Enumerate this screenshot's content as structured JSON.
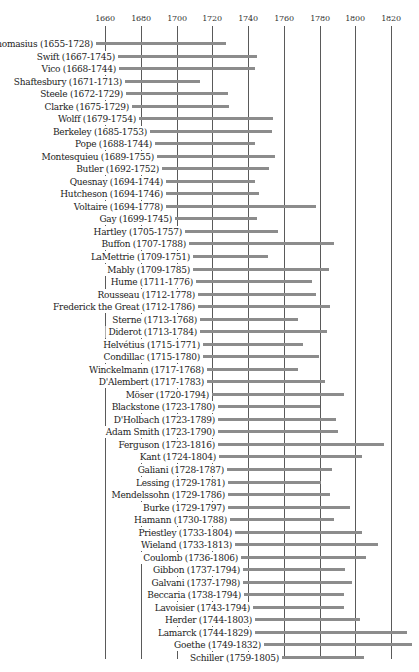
{
  "chart_data": {
    "type": "bar",
    "orientation": "horizontal-timeline",
    "title": "",
    "xlabel": "",
    "ylabel": "",
    "xlim": [
      1640,
      1836
    ],
    "grid": {
      "vertical_lines_at_ticks": true
    },
    "x_ticks": [
      1660,
      1680,
      1700,
      1720,
      1740,
      1760,
      1780,
      1800,
      1820
    ],
    "series": [
      {
        "name": "Thomasius",
        "start": 1655,
        "end": 1728,
        "label": "Thomasius (1655-1728)"
      },
      {
        "name": "Swift",
        "start": 1667,
        "end": 1745,
        "label": "Swift (1667-1745)"
      },
      {
        "name": "Vico",
        "start": 1668,
        "end": 1744,
        "label": "Vico (1668-1744)"
      },
      {
        "name": "Shaftesbury",
        "start": 1671,
        "end": 1713,
        "label": "Shaftesbury (1671-1713)"
      },
      {
        "name": "Steele",
        "start": 1672,
        "end": 1729,
        "label": "Steele (1672-1729)"
      },
      {
        "name": "Clarke",
        "start": 1675,
        "end": 1729,
        "label": "Clarke (1675-1729)"
      },
      {
        "name": "Wolff",
        "start": 1679,
        "end": 1754,
        "label": "Wolff (1679-1754)"
      },
      {
        "name": "Berkeley",
        "start": 1685,
        "end": 1753,
        "label": "Berkeley (1685-1753)"
      },
      {
        "name": "Pope",
        "start": 1688,
        "end": 1744,
        "label": "Pope (1688-1744)"
      },
      {
        "name": "Montesquieu",
        "start": 1689,
        "end": 1755,
        "label": "Montesquieu (1689-1755)"
      },
      {
        "name": "Butler",
        "start": 1692,
        "end": 1752,
        "label": "Butler (1692-1752)"
      },
      {
        "name": "Quesnay",
        "start": 1694,
        "end": 1744,
        "label": "Quesnay (1694-1744)"
      },
      {
        "name": "Hutcheson",
        "start": 1694,
        "end": 1746,
        "label": "Hutcheson (1694-1746)"
      },
      {
        "name": "Voltaire",
        "start": 1694,
        "end": 1778,
        "label": "Voltaire (1694-1778)"
      },
      {
        "name": "Gay",
        "start": 1699,
        "end": 1745,
        "label": "Gay (1699-1745)"
      },
      {
        "name": "Hartley",
        "start": 1705,
        "end": 1757,
        "label": "Hartley (1705-1757)"
      },
      {
        "name": "Buffon",
        "start": 1707,
        "end": 1788,
        "label": "Buffon (1707-1788)"
      },
      {
        "name": "LaMettrie",
        "start": 1709,
        "end": 1751,
        "label": "LaMettrie (1709-1751)"
      },
      {
        "name": "Mably",
        "start": 1709,
        "end": 1785,
        "label": "Mably (1709-1785)"
      },
      {
        "name": "Hume",
        "start": 1711,
        "end": 1776,
        "label": "Hume (1711-1776)"
      },
      {
        "name": "Rousseau",
        "start": 1712,
        "end": 1778,
        "label": "Rousseau (1712-1778)"
      },
      {
        "name": "Frederick the Great",
        "start": 1712,
        "end": 1786,
        "label": "Frederick the Great (1712-1786)"
      },
      {
        "name": "Sterne",
        "start": 1713,
        "end": 1768,
        "label": "Sterne (1713-1768)"
      },
      {
        "name": "Diderot",
        "start": 1713,
        "end": 1784,
        "label": "Diderot (1713-1784)"
      },
      {
        "name": "Helvétius",
        "start": 1715,
        "end": 1771,
        "label": "Helvétius (1715-1771)"
      },
      {
        "name": "Condillac",
        "start": 1715,
        "end": 1780,
        "label": "Condillac (1715-1780)"
      },
      {
        "name": "Winckelmann",
        "start": 1717,
        "end": 1768,
        "label": "Winckelmann (1717-1768)"
      },
      {
        "name": "D'Alembert",
        "start": 1717,
        "end": 1783,
        "label": "D'Alembert (1717-1783)"
      },
      {
        "name": "Möser",
        "start": 1720,
        "end": 1794,
        "label": "Möser (1720-1794)"
      },
      {
        "name": "Blackstone",
        "start": 1723,
        "end": 1780,
        "label": "Blackstone (1723-1780)"
      },
      {
        "name": "D'Holbach",
        "start": 1723,
        "end": 1789,
        "label": "D'Holbach (1723-1789)"
      },
      {
        "name": "Adam Smith",
        "start": 1723,
        "end": 1790,
        "label": "Adam Smith (1723-1790)"
      },
      {
        "name": "Ferguson",
        "start": 1723,
        "end": 1816,
        "label": "Ferguson (1723-1816)"
      },
      {
        "name": "Kant",
        "start": 1724,
        "end": 1804,
        "label": "Kant (1724-1804)"
      },
      {
        "name": "Galiani",
        "start": 1728,
        "end": 1787,
        "label": "Galiani (1728-1787)"
      },
      {
        "name": "Lessing",
        "start": 1729,
        "end": 1781,
        "label": "Lessing (1729-1781)"
      },
      {
        "name": "Mendelssohn",
        "start": 1729,
        "end": 1786,
        "label": "Mendelssohn (1729-1786)"
      },
      {
        "name": "Burke",
        "start": 1729,
        "end": 1797,
        "label": "Burke (1729-1797)"
      },
      {
        "name": "Hamann",
        "start": 1730,
        "end": 1788,
        "label": "Hamann (1730-1788)"
      },
      {
        "name": "Priestley",
        "start": 1733,
        "end": 1804,
        "label": "Priestley (1733-1804)"
      },
      {
        "name": "Wieland",
        "start": 1733,
        "end": 1813,
        "label": "Wieland (1733-1813)"
      },
      {
        "name": "Coulomb",
        "start": 1736,
        "end": 1806,
        "label": "Coulomb (1736-1806)"
      },
      {
        "name": "Gibbon",
        "start": 1737,
        "end": 1794,
        "label": "Gibbon (1737-1794)"
      },
      {
        "name": "Galvani",
        "start": 1737,
        "end": 1798,
        "label": "Galvani (1737-1798)"
      },
      {
        "name": "Beccaria",
        "start": 1738,
        "end": 1794,
        "label": "Beccaria (1738-1794)"
      },
      {
        "name": "Lavoisier",
        "start": 1743,
        "end": 1794,
        "label": "Lavoisier (1743-1794)"
      },
      {
        "name": "Herder",
        "start": 1744,
        "end": 1803,
        "label": "Herder (1744-1803)"
      },
      {
        "name": "Lamarck",
        "start": 1744,
        "end": 1829,
        "label": "Lamarck (1744-1829)"
      },
      {
        "name": "Goethe",
        "start": 1749,
        "end": 1832,
        "label": "Goethe (1749-1832)"
      },
      {
        "name": "Schiller",
        "start": 1759,
        "end": 1805,
        "label": "Schiller (1759-1805)"
      }
    ]
  },
  "colors": {
    "bar": "#8c8c8c",
    "gridline": "#5a5a5a",
    "text": "#222222",
    "background": "#ffffff"
  },
  "layout": {
    "x0_year": 1660,
    "x0_px": 105,
    "px_per_year": 1.7875,
    "first_row_y": 38,
    "row_spacing": 12.53,
    "label_gap_px": 4
  }
}
